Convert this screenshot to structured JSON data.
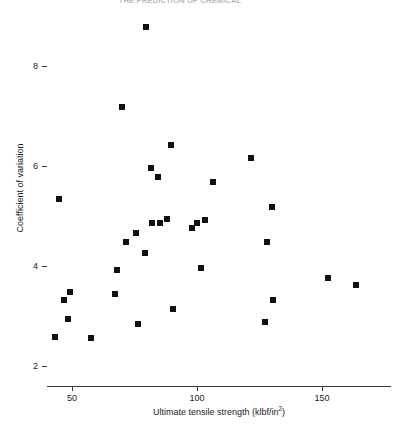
{
  "chart_data": {
    "type": "scatter",
    "title": "THE PREDICTION OF CHEMICAL",
    "xlabel": "Ultimate tensile strength (klbf/in²)",
    "xlabel_base": "Ultimate tensile strength (klbf/in",
    "xlabel_sup": "2",
    "xlabel_tail": ")",
    "ylabel": "Coefficient of variation",
    "xlim": [
      42,
      180
    ],
    "ylim": [
      2,
      9.1
    ],
    "xticks": [
      50,
      100,
      150
    ],
    "xticklabels": [
      "50",
      "100",
      "150"
    ],
    "yticks": [
      2,
      4,
      6,
      8
    ],
    "yticklabels": [
      "2",
      "4",
      "6",
      "8"
    ],
    "grid": false,
    "legend": null,
    "marker": "square",
    "marker_color": "#111111",
    "points": [
      {
        "x": 79.6,
        "y": 8.78
      },
      {
        "x": 70.0,
        "y": 7.18
      },
      {
        "x": 89.6,
        "y": 6.42
      },
      {
        "x": 121.6,
        "y": 6.16
      },
      {
        "x": 81.6,
        "y": 5.96
      },
      {
        "x": 106.4,
        "y": 5.68
      },
      {
        "x": 84.4,
        "y": 5.78
      },
      {
        "x": 44.8,
        "y": 5.34
      },
      {
        "x": 130.0,
        "y": 5.18
      },
      {
        "x": 75.6,
        "y": 4.66
      },
      {
        "x": 88.0,
        "y": 4.94
      },
      {
        "x": 82.0,
        "y": 4.86
      },
      {
        "x": 85.2,
        "y": 4.86
      },
      {
        "x": 100.0,
        "y": 4.86
      },
      {
        "x": 103.2,
        "y": 4.92
      },
      {
        "x": 98.0,
        "y": 4.76
      },
      {
        "x": 71.6,
        "y": 4.48
      },
      {
        "x": 128.0,
        "y": 4.48
      },
      {
        "x": 79.2,
        "y": 4.26
      },
      {
        "x": 68.0,
        "y": 3.92
      },
      {
        "x": 101.6,
        "y": 3.96
      },
      {
        "x": 67.2,
        "y": 3.44
      },
      {
        "x": 49.2,
        "y": 3.48
      },
      {
        "x": 46.8,
        "y": 3.32
      },
      {
        "x": 130.4,
        "y": 3.32
      },
      {
        "x": 152.4,
        "y": 3.76
      },
      {
        "x": 163.6,
        "y": 3.62
      },
      {
        "x": 48.4,
        "y": 2.94
      },
      {
        "x": 43.2,
        "y": 2.58
      },
      {
        "x": 57.6,
        "y": 2.56
      },
      {
        "x": 76.4,
        "y": 2.84
      },
      {
        "x": 127.2,
        "y": 2.88
      },
      {
        "x": 90.4,
        "y": 3.14
      }
    ]
  }
}
